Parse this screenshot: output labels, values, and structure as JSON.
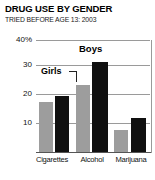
{
  "chart_data": {
    "type": "bar",
    "title": "DRUG USE BY GENDER",
    "subtitle": "TRIED BEFORE AGE 13: 2003",
    "xlabel": "",
    "ylabel": "",
    "ylim": [
      0,
      40
    ],
    "yticks": [
      10,
      20,
      30,
      40
    ],
    "ytick_labels": [
      "10",
      "20",
      "30",
      "40%"
    ],
    "grid": true,
    "legend_position": "inline-callout",
    "categories": [
      "Cigarettes",
      "Alcohol",
      "Marijuana"
    ],
    "series": [
      {
        "name": "Girls",
        "color": "#9d9d9d",
        "values": [
          18,
          24,
          8
        ]
      },
      {
        "name": "Boys",
        "color": "#101010",
        "values": [
          20,
          32,
          12
        ]
      }
    ],
    "annotations": [
      {
        "text": "Girls",
        "target": "Girls / Alcohol bar"
      },
      {
        "text": "Boys",
        "target": "Boys / Alcohol bar"
      }
    ]
  },
  "axis": {
    "tick_40": "40%",
    "tick_30": "30",
    "tick_20": "20",
    "tick_10": "10"
  },
  "categories": {
    "c0": "Cigarettes",
    "c1": "Alcohol",
    "c2": "Marijuana"
  },
  "callouts": {
    "girls": "Girls",
    "boys": "Boys"
  }
}
